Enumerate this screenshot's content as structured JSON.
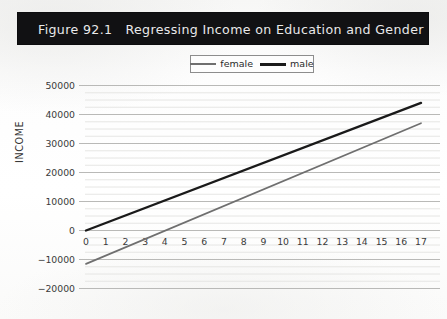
{
  "figure": {
    "banner_title": "Figure 92.1   Regressing Income on Education and Gender",
    "banner_color": "#111113",
    "banner_text_color": "#e9e9ea"
  },
  "legend": {
    "position": "top-center",
    "entries": [
      {
        "label": "female",
        "color": "#6f6f6f",
        "swatch": "line-swatch-female"
      },
      {
        "label": "male",
        "color": "#1a1a1a",
        "swatch": "line-swatch-male"
      }
    ]
  },
  "axes": {
    "y_title": "INCOME",
    "y_ticks": [
      "50000",
      "40000",
      "30000",
      "20000",
      "10000",
      "0",
      "−10000",
      "−20000"
    ],
    "x_ticks": [
      "0",
      "1",
      "2",
      "3",
      "4",
      "5",
      "6",
      "7",
      "8",
      "9",
      "10",
      "11",
      "12",
      "13",
      "14",
      "15",
      "16",
      "17"
    ]
  },
  "chart_data": {
    "type": "line",
    "title": "Figure 92.1   Regressing Income on Education and Gender",
    "xlabel": "",
    "ylabel": "INCOME",
    "xlim": [
      0,
      17
    ],
    "ylim": [
      -20000,
      50000
    ],
    "ytick_values": [
      50000,
      40000,
      30000,
      20000,
      10000,
      0,
      -10000,
      -20000
    ],
    "xtick_values": [
      0,
      1,
      2,
      3,
      4,
      5,
      6,
      7,
      8,
      9,
      10,
      11,
      12,
      13,
      14,
      15,
      16,
      17
    ],
    "grid": "horizontal-major-and-minor",
    "minor_gridlines_per_major": 4,
    "legend_position": "top-center",
    "x": [
      0,
      17
    ],
    "series": [
      {
        "name": "female",
        "color": "#6f6f6f",
        "linewidth": 1.7,
        "values": [
          -11500,
          37000
        ],
        "intercept": -11500,
        "slope": 2853
      },
      {
        "name": "male",
        "color": "#1a1a1a",
        "linewidth": 2.4,
        "values": [
          0,
          44000
        ],
        "intercept": 0,
        "slope": 2588
      }
    ]
  }
}
